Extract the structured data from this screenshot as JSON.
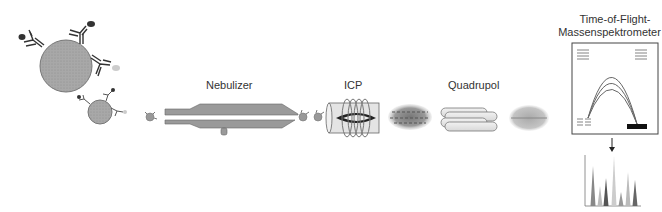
{
  "diagram": {
    "type": "process-flow",
    "stages": [
      {
        "id": "labeled-cells",
        "label": ""
      },
      {
        "id": "nebulizer",
        "label": "Nebulizer"
      },
      {
        "id": "icp",
        "label": "ICP"
      },
      {
        "id": "quadrupol",
        "label": "Quadrupol"
      },
      {
        "id": "tof",
        "label_line1": "Time-of-Flight-",
        "label_line2": "Massenspektrometer"
      }
    ],
    "labels": {
      "nebulizer": "Nebulizer",
      "icp": "ICP",
      "quadrupol": "Quadrupol",
      "tof_line1": "Time-of-Flight-",
      "tof_line2": "Massenspektrometer"
    },
    "colors": {
      "particle_gray": "#a8a8a8",
      "outline": "#666666",
      "antibody": "#444444",
      "detector": "#111111",
      "tube_fill": "#e6e6e6"
    },
    "spectrum_peaks": [
      {
        "x": 8,
        "height": 40,
        "shade": "#888"
      },
      {
        "x": 15,
        "height": 20,
        "shade": "#bbb"
      },
      {
        "x": 21,
        "height": 28,
        "shade": "#555"
      },
      {
        "x": 29,
        "height": 50,
        "shade": "#ccc"
      },
      {
        "x": 36,
        "height": 14,
        "shade": "#999"
      },
      {
        "x": 43,
        "height": 34,
        "shade": "#bbb"
      },
      {
        "x": 50,
        "height": 26,
        "shade": "#666"
      }
    ]
  }
}
